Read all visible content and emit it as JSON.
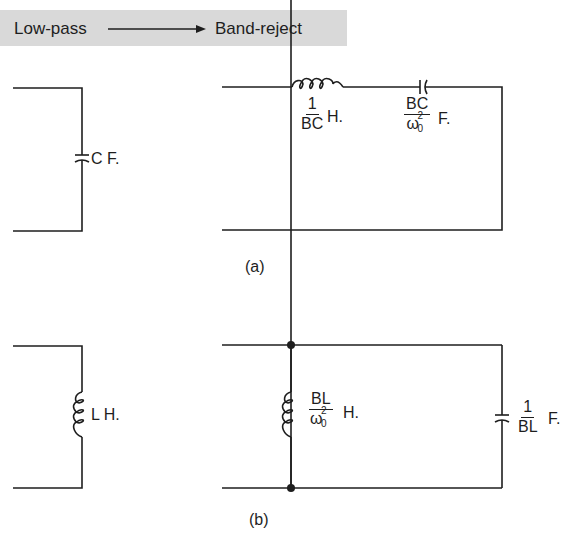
{
  "header": {
    "from_label": "Low-pass",
    "to_label": "Band-reject",
    "arrow": "right-arrow"
  },
  "diagram_a": {
    "caption": "(a)",
    "lowpass_element": {
      "type": "capacitor",
      "label": "C F."
    },
    "bandreject_elements": [
      {
        "type": "inductor",
        "numerator": "1",
        "denominator": "BC",
        "unit": "H.",
        "connection": "series"
      },
      {
        "type": "capacitor",
        "numerator": "BC",
        "denominator": "ω",
        "denominator_sup": "2",
        "denominator_sub": "0",
        "unit": "F.",
        "connection": "series"
      }
    ]
  },
  "diagram_b": {
    "caption": "(b)",
    "lowpass_element": {
      "type": "inductor",
      "label": "L H."
    },
    "bandreject_elements": [
      {
        "type": "inductor",
        "numerator": "BL",
        "denominator": "ω",
        "denominator_sup": "2",
        "denominator_sub": "0",
        "unit": "H.",
        "connection": "shunt"
      },
      {
        "type": "capacitor",
        "numerator": "1",
        "denominator": "BL",
        "unit": "F.",
        "connection": "shunt"
      }
    ]
  },
  "colors": {
    "line": "#1e1e1e",
    "band": "#d9d9d9"
  }
}
